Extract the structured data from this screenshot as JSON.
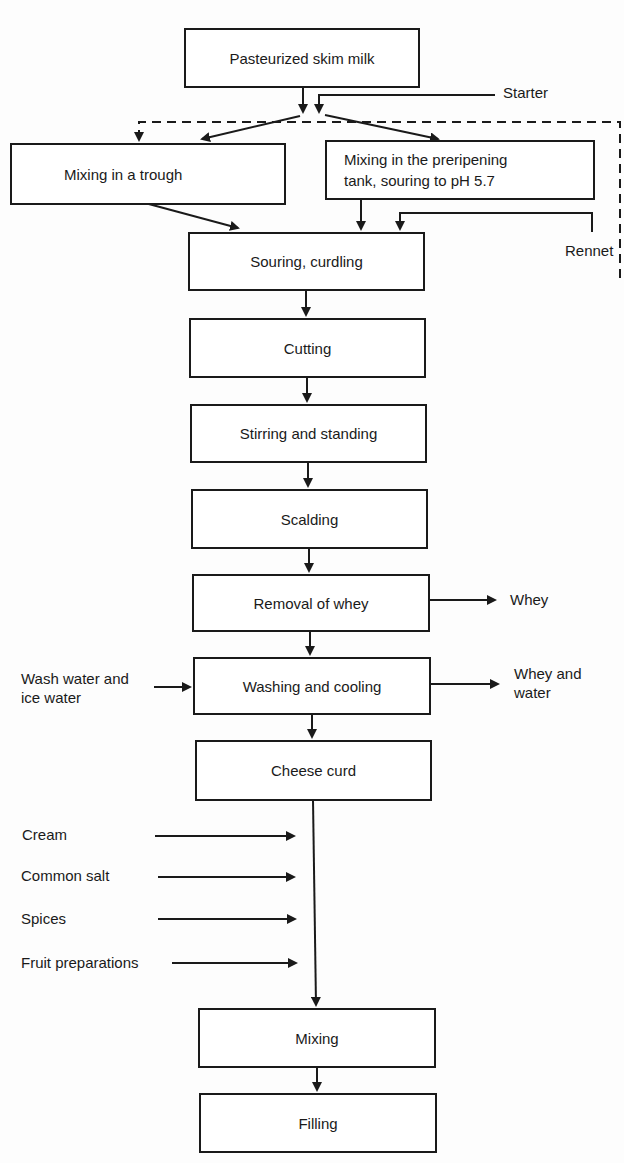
{
  "diagram": {
    "type": "process-flow",
    "steps": {
      "pasteurized": "Pasteurized skim milk",
      "trough": "Mixing in a trough",
      "preripening_line1": "Mixing in the preripening",
      "preripening_line2": "tank, souring to pH 5.7",
      "souring": "Souring, curdling",
      "cutting": "Cutting",
      "stirring": "Stirring and standing",
      "scalding": "Scalding",
      "removal": "Removal of whey",
      "washing": "Washing and cooling",
      "curd": "Cheese curd",
      "mixing": "Mixing",
      "filling": "Filling"
    },
    "inputs": {
      "starter": "Starter",
      "rennet": "Rennet",
      "wash_line1": "Wash water and",
      "wash_line2": "ice water",
      "cream": "Cream",
      "salt": "Common salt",
      "spices": "Spices",
      "fruit": "Fruit preparations"
    },
    "outputs": {
      "whey": "Whey",
      "whey_water_line1": "Whey and",
      "whey_water_line2": "water"
    },
    "edges": [
      {
        "from": "pasteurized",
        "to": "trough"
      },
      {
        "from": "pasteurized",
        "to": "preripening"
      },
      {
        "from": "starter",
        "to": "trough",
        "style": "dashed"
      },
      {
        "from": "starter",
        "to": "preripening"
      },
      {
        "from": "trough",
        "to": "souring"
      },
      {
        "from": "preripening",
        "to": "souring"
      },
      {
        "from": "rennet",
        "to": "souring"
      },
      {
        "from": "souring",
        "to": "cutting"
      },
      {
        "from": "cutting",
        "to": "stirring"
      },
      {
        "from": "stirring",
        "to": "scalding"
      },
      {
        "from": "scalding",
        "to": "removal"
      },
      {
        "from": "removal",
        "to": "whey"
      },
      {
        "from": "removal",
        "to": "washing"
      },
      {
        "from": "wash_water",
        "to": "washing"
      },
      {
        "from": "washing",
        "to": "whey_water"
      },
      {
        "from": "washing",
        "to": "curd"
      },
      {
        "from": "curd",
        "to": "mixing"
      },
      {
        "from": "cream",
        "to": "mixing"
      },
      {
        "from": "salt",
        "to": "mixing"
      },
      {
        "from": "spices",
        "to": "mixing"
      },
      {
        "from": "fruit",
        "to": "mixing"
      },
      {
        "from": "mixing",
        "to": "filling"
      }
    ]
  }
}
